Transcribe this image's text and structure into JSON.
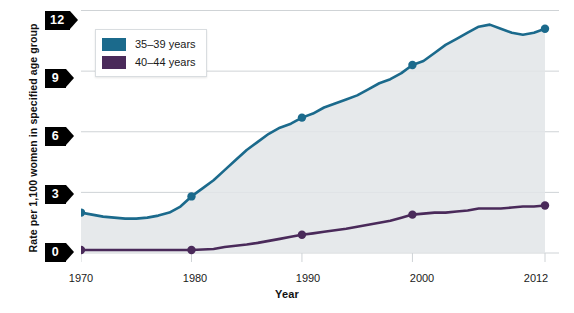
{
  "axes": {
    "y_title": "Rate per 1,100 women in specified age group",
    "x_title": "Year",
    "y_ticks": [
      "0",
      "3",
      "6",
      "9",
      "12"
    ],
    "x_ticks": [
      "1970",
      "1980",
      "1990",
      "2000",
      "2012"
    ]
  },
  "legend": {
    "items": [
      {
        "label": "35–39 years",
        "color": "#1b6a8c",
        "name": "series-35-39"
      },
      {
        "label": "40–44 years",
        "color": "#4a2a5a",
        "name": "series-40-44"
      }
    ]
  },
  "colors": {
    "blue": "#1b6a8c",
    "purple": "#4a2a5a",
    "gridline": "#cfd3d6",
    "area_fill": "#e2e5e7"
  },
  "chart_data": {
    "type": "line",
    "title": "",
    "xlabel": "Year",
    "ylabel": "Rate per 1,100 women in specified age group",
    "xlim": [
      1970,
      2012
    ],
    "ylim": [
      0,
      12
    ],
    "grid": true,
    "legend_position": "top-left",
    "markers_at": [
      1970,
      1980,
      1990,
      2000,
      2012
    ],
    "x": [
      1970,
      1971,
      1972,
      1973,
      1974,
      1975,
      1976,
      1977,
      1978,
      1979,
      1980,
      1981,
      1982,
      1983,
      1984,
      1985,
      1986,
      1987,
      1988,
      1989,
      1990,
      1991,
      1992,
      1993,
      1994,
      1995,
      1996,
      1997,
      1998,
      1999,
      2000,
      2001,
      2002,
      2003,
      2004,
      2005,
      2006,
      2007,
      2008,
      2009,
      2010,
      2011,
      2012
    ],
    "series": [
      {
        "name": "35–39 years",
        "color": "#1b6a8c",
        "values": [
          2.0,
          1.9,
          1.8,
          1.75,
          1.7,
          1.7,
          1.75,
          1.85,
          2.0,
          2.3,
          2.8,
          3.2,
          3.6,
          4.1,
          4.6,
          5.1,
          5.5,
          5.9,
          6.2,
          6.4,
          6.7,
          6.9,
          7.2,
          7.4,
          7.6,
          7.8,
          8.1,
          8.4,
          8.6,
          8.9,
          9.3,
          9.5,
          9.9,
          10.3,
          10.6,
          10.9,
          11.2,
          11.3,
          11.1,
          10.9,
          10.8,
          10.9,
          11.1
        ]
      },
      {
        "name": "40–44 years",
        "color": "#4a2a5a",
        "values": [
          0.15,
          0.15,
          0.15,
          0.15,
          0.15,
          0.15,
          0.15,
          0.15,
          0.15,
          0.15,
          0.15,
          0.17,
          0.2,
          0.3,
          0.36,
          0.42,
          0.5,
          0.6,
          0.7,
          0.8,
          0.9,
          0.97,
          1.05,
          1.13,
          1.2,
          1.3,
          1.4,
          1.5,
          1.6,
          1.75,
          1.9,
          1.95,
          2.0,
          2.0,
          2.05,
          2.1,
          2.2,
          2.2,
          2.2,
          2.25,
          2.3,
          2.3,
          2.35
        ]
      }
    ]
  }
}
